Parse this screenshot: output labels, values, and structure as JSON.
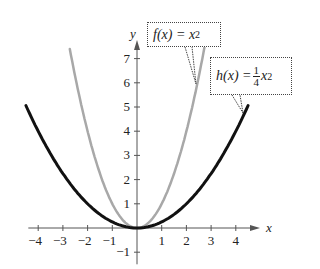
{
  "chart_data": {
    "type": "line",
    "title": "",
    "xlabel": "x",
    "ylabel": "y",
    "xlim": [
      -4.5,
      4.8
    ],
    "ylim": [
      -1.3,
      7.8
    ],
    "x_ticks": [
      -4,
      -3,
      -2,
      -1,
      1,
      2,
      3,
      4
    ],
    "x_tick_labels": [
      "−4",
      "−3",
      "−2",
      "−1",
      "1",
      "2",
      "3",
      "4"
    ],
    "y_ticks": [
      -1,
      1,
      2,
      3,
      4,
      5,
      6,
      7
    ],
    "y_tick_labels": [
      "−1",
      "1",
      "2",
      "3",
      "4",
      "5",
      "6",
      "7"
    ],
    "grid": false,
    "series": [
      {
        "name": "f(x) = x^2",
        "formula": "x^2",
        "color": "#a8a8a8",
        "x_range": [
          -2.72,
          2.78
        ],
        "x": [
          -2.72,
          -2,
          -1,
          0,
          1,
          2,
          2.78
        ],
        "values": [
          7.4,
          4,
          1,
          0,
          1,
          4,
          7.73
        ]
      },
      {
        "name": "h(x) = 1/4 x^2",
        "formula": "0.25*x^2",
        "color": "#111111",
        "x_range": [
          -4.5,
          4.5
        ],
        "x": [
          -4.5,
          -4,
          -2,
          0,
          2,
          4,
          4.5
        ],
        "values": [
          5.06,
          4,
          1,
          0,
          1,
          4,
          5.06
        ]
      }
    ],
    "annotations": [
      {
        "label": "f(x) = x^2",
        "points_to_series": 0
      },
      {
        "label": "h(x) = 1/4 x^2",
        "points_to_series": 1
      }
    ]
  },
  "labels": {
    "x_axis": "x",
    "y_axis": "y",
    "f_name": "f(x) = x",
    "f_exp": "2",
    "h_name": "h(x) =",
    "h_num": "1",
    "h_den": "4",
    "h_var": "x",
    "h_exp": "2"
  }
}
